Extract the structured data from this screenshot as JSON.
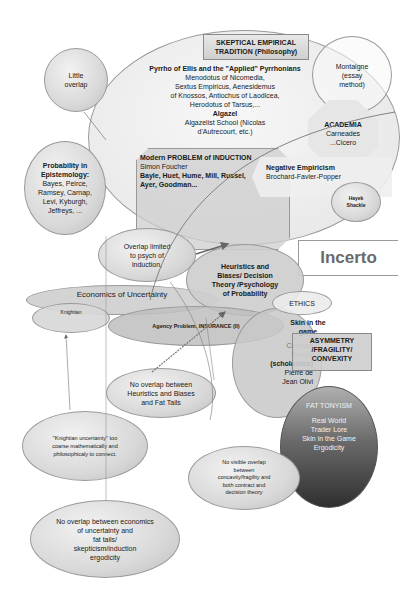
{
  "title": "Incerto",
  "skeptical": {
    "heading_line1": "SKEPTICAL EMPIRICAL",
    "heading_line2": "TRADITION (Philosophy)",
    "pyrrho": "Pyrrho of Ellis and the \"Applied\" Pyrrhonians",
    "lines": [
      "Menodotus of Nicomedia,",
      "Sextus Empiricus, Aenesidemus",
      "of Knossos, Antiochus of Laodicea,",
      "Herodotus of Tarsus,..."
    ],
    "algazel": "Algazel",
    "algazel_lines": [
      "Algazelist School (Nicolas",
      "d'Autrecourt, etc.)"
    ]
  },
  "montaigne": {
    "lines": [
      "Montaigne",
      "(essay",
      "method)"
    ]
  },
  "academia": {
    "title": "ACADEMIA",
    "lines": [
      "Carneades",
      "...Cicero"
    ]
  },
  "induction": {
    "title": "Modern PROBLEM of INDUCTION",
    "lines": [
      "Simon Foucher",
      "Bayle, Huet, Hume, Mill, Russel,",
      "Ayer, Goodman..."
    ]
  },
  "negative_empiricism": {
    "title": "Negative Empiricism",
    "subtitle": "Brochard-Favier-Popper"
  },
  "hayek": {
    "lines": [
      "Hayek",
      "Shackle"
    ]
  },
  "little_overlap": {
    "lines": [
      "Little",
      "overlap"
    ]
  },
  "probability": {
    "title_lines": [
      "Probability in",
      "Epistemology:"
    ],
    "lines": [
      "Bayes, Peirce,",
      "Ramsey, Carnap,",
      "Levi, Kyburgh,",
      "Jeffreys, ..."
    ]
  },
  "overlap_limited": {
    "lines": [
      "Overlap limited",
      "to psych of",
      "induction,"
    ]
  },
  "heuristics": {
    "lines": [
      "Heuristics and",
      "Biases/  Decision",
      "Theory /Psychology",
      "of Probability"
    ]
  },
  "economics": {
    "title": "Economics of Uncertainty",
    "knightian": "Knightian"
  },
  "agency": {
    "label": "Agency Problem,  INSURANCE (II)"
  },
  "ethics": {
    "label": "ETHICS"
  },
  "skin": {
    "lines": [
      "Skin in the",
      "game"
    ]
  },
  "contract": {
    "lines_light": [
      "Contract",
      "Theory"
    ],
    "lines_dark": [
      "(scholastics)",
      "Pierre de",
      "Jean Olivi"
    ]
  },
  "asymmetry": {
    "lines": [
      "ASYMMETRY",
      "/FRAGILITY/",
      "CONVEXITY"
    ]
  },
  "fat_tonyism": {
    "title": "FAT TONYISM",
    "lines": [
      "Real World",
      "Trader Lore",
      "Skin in the Game",
      "Ergodicity"
    ]
  },
  "notes": {
    "no_overlap_hb": [
      "No overlap between",
      "Heuristics and Biases",
      "and Fat Tails"
    ],
    "knightian_coarse": [
      "\"Knightian uncertainty\" too",
      "coarse mathematically and",
      "philosophicaly to connect."
    ],
    "no_visible": [
      "No visible overlap",
      "between",
      "concavity/fragility and",
      "both contract and",
      "decision theory"
    ],
    "no_overlap_econ": [
      "No overlap between economics",
      "of uncertainty and",
      "fat tails/",
      "skepticism/induction",
      "ergodicity"
    ]
  },
  "colors": {
    "fat_tonyism_top": "#b8b8b8",
    "fat_tonyism_bottom": "#3a3a3a",
    "node_fill": "#d9d9d9",
    "stroke": "#8a8a8a"
  }
}
